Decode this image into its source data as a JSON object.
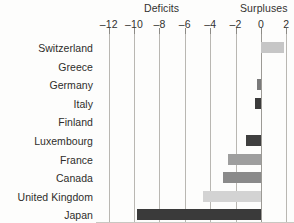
{
  "header": {
    "deficits_label": "Deficits",
    "surpluses_label": "Surpluses"
  },
  "chart_data": {
    "type": "bar",
    "orientation": "horizontal",
    "title": "",
    "subtitle": "",
    "xlabel": "",
    "ylabel": "",
    "xlim": [
      -13,
      2.6
    ],
    "grid": true,
    "legend": "none",
    "axis_side": "top",
    "section_labels": [
      "Deficits",
      "Surpluses"
    ],
    "xticks": [
      -12,
      -10,
      -8,
      -6,
      -4,
      -2,
      0,
      2
    ],
    "xticklabels": [
      "–12",
      "–10",
      "–8",
      "–6",
      "–4",
      "–2",
      "0",
      "2"
    ],
    "categories": [
      "Switzerland",
      "Greece",
      "Germany",
      "Italy",
      "Finland",
      "Luxembourg",
      "France",
      "Canada",
      "United Kingdom",
      "Japan"
    ],
    "values": [
      1.8,
      0,
      -0.3,
      -0.5,
      0,
      -1.2,
      -2.6,
      -3.0,
      -4.6,
      -9.8
    ],
    "bar_colors": [
      "#c6c6c6",
      "#c6c6c6",
      "#7a7a7a",
      "#3b3b3b",
      "#c6c6c6",
      "#3f3f3f",
      "#9e9e9e",
      "#8a8a8a",
      "#d3d3d3",
      "#3a3a3a"
    ]
  },
  "colors": {
    "gridline": "#b9b7b2",
    "zero_line": "#9c9a95",
    "text": "#2e2d2b",
    "background": "#fdfdfc"
  }
}
